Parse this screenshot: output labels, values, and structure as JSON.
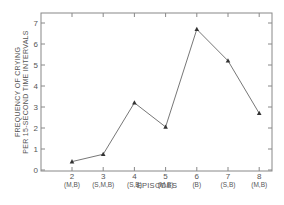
{
  "chart_data": {
    "type": "line",
    "title": "",
    "xlabel": "EPISODES",
    "ylabel_line1": "FREQUENCY OF CRYING",
    "ylabel_line2": "PER 15-SECOND TIME INTERVALS",
    "x": [
      2,
      3,
      4,
      5,
      6,
      7,
      8
    ],
    "x_tick_labels": [
      "2",
      "3",
      "4",
      "5",
      "6",
      "7",
      "8"
    ],
    "x_sublabels": [
      "(M,B)",
      "(S,M,B)",
      "(S,B)",
      "(M,B)",
      "(B)",
      "(S,B)",
      "(M,B)"
    ],
    "values": [
      0.4,
      0.75,
      3.2,
      2.05,
      6.7,
      5.2,
      2.7
    ],
    "y_ticks": [
      0,
      1,
      2,
      3,
      4,
      5,
      6,
      7
    ],
    "ylim": [
      0,
      7.5
    ],
    "xlim": [
      1,
      8.5
    ],
    "grid": false,
    "marker": "triangle",
    "colors": {
      "line": "#777777",
      "axis": "#888888",
      "text": "#555555"
    }
  }
}
